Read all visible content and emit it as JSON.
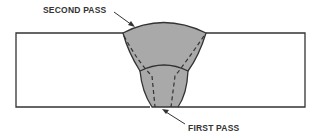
{
  "figure": {
    "labels": {
      "second_pass": "SECOND PASS",
      "first_pass": "FIRST PASS"
    },
    "colors": {
      "weld_fill": "#a9a9a9",
      "outline": "#333333",
      "background": "#ffffff"
    },
    "parts": [
      "left-plate",
      "right-plate",
      "second-pass-bead",
      "first-pass-bead"
    ]
  }
}
